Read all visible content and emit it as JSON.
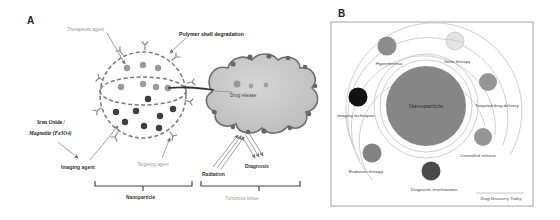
{
  "panels": {
    "a": {
      "label": "A",
      "labels": {
        "therapeutic_agent": "Therapeutic agent",
        "polymer_shell": "Polymer shell degradation",
        "iron_oxide_line1": "Iron Oxide /",
        "iron_oxide_line2": "Magnetite (Fe3O4)",
        "imaging_agent": "Imaging agent",
        "targeting_agent": "Targeting agent",
        "drug_release": "Drug release",
        "radiation": "Radiation",
        "diagnosis": "Diagnosis",
        "nanoparticle": "Nanoparticle",
        "tumorous_tissue": "Tumorous tissue"
      },
      "colors": {
        "shell_dash": "#7a7a7a",
        "therapeutic_dot": "#9a9a9a",
        "imaging_dot": "#3e3e3e",
        "tumor_fill": "#c9c9c9",
        "tumor_edge": "#6e6e6e",
        "gray_label": "#9a9a9a"
      }
    },
    "b": {
      "label": "B",
      "center_label": "Nanoparticle",
      "credit": "Drug Discovery Today",
      "satellites": [
        {
          "label": "Hyperthermia",
          "color": "#8c8c8c"
        },
        {
          "label": "Gene therapy",
          "color": "#e4e4e4"
        },
        {
          "label": "Targeted drug delivery",
          "color": "#959595"
        },
        {
          "label": "Controlled release",
          "color": "#959595"
        },
        {
          "label": "Diagnostic mechanisms",
          "color": "#4a4a4a"
        },
        {
          "label": "Radiation therapy",
          "color": "#828282"
        },
        {
          "label": "Imaging techniques",
          "color": "#111111"
        }
      ],
      "colors": {
        "center_fill": "#868686",
        "orbit": "#c8c8c8",
        "frame": "#9a9a9a"
      }
    }
  }
}
